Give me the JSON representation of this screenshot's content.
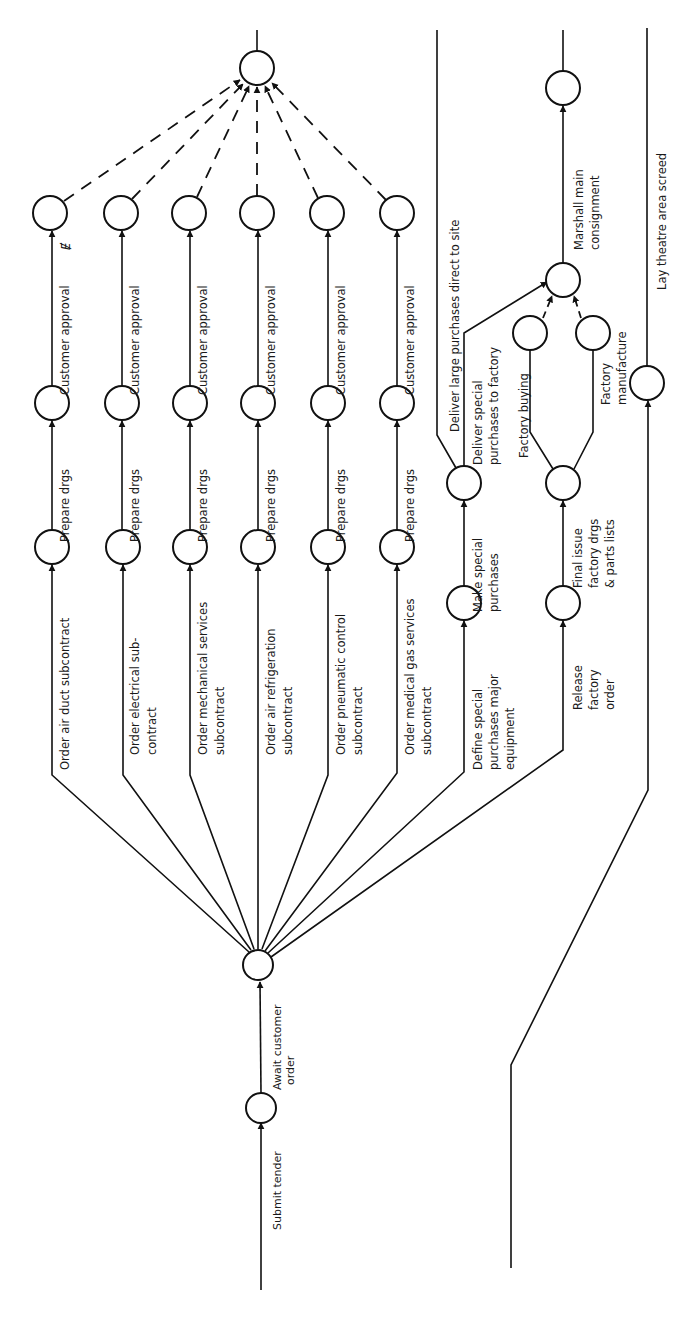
{
  "diagram": {
    "type": "activity network (arrow diagram)",
    "orientation": "rotated 90 degrees counter-clockwise; flow runs bottom to top",
    "colors": {
      "ink": "#111111",
      "paper": "#ffffff"
    },
    "chains": [
      {
        "order": "Order air duct subcontract",
        "prepare": "Prepare drgs",
        "approval": "Customer approval"
      },
      {
        "order": "Order electrical sub-",
        "order2": "contract",
        "prepare": "Prepare drgs",
        "approval": "Customer approval"
      },
      {
        "order": "Order mechanical services",
        "order2": "subcontract",
        "prepare": "Prepare drgs",
        "approval": "Customer approval"
      },
      {
        "order": "Order air refrigeration",
        "order2": "subcontract",
        "prepare": "Prepare drgs",
        "approval": "Customer approval"
      },
      {
        "order": "Order pneumatic control",
        "order2": "subcontract",
        "prepare": "Prepare drgs",
        "approval": "Customer approval"
      },
      {
        "order": "Order medical gas services",
        "order2": "subcontract",
        "prepare": "Prepare drgs",
        "approval": "Customer approval"
      }
    ],
    "start": {
      "submit_tender": "Submit tender",
      "await_order_1": "Await customer",
      "await_order_2": "order"
    },
    "special_purchases": {
      "define_1": "Define special",
      "define_2": "purchases major",
      "define_3": "equipment",
      "make_1": "Make special",
      "make_2": "purchases",
      "deliver_factory_1": "Deliver special",
      "deliver_factory_2": "purchases to factory",
      "deliver_site": "Deliver large purchases direct to site"
    },
    "factory": {
      "release_1": "Release",
      "release_2": "factory",
      "release_3": "order",
      "final_issue_1": "Final issue",
      "final_issue_2": "factory drgs",
      "final_issue_3": "& parts lists",
      "buying": "Factory buying",
      "manufacture_1": "Factory",
      "manufacture_2": "manufacture",
      "marshall_1": "Marshall main",
      "marshall_2": "consignment"
    },
    "screed": {
      "label": "Lay theatre area screed"
    },
    "margin_mark": "Ɇ"
  }
}
